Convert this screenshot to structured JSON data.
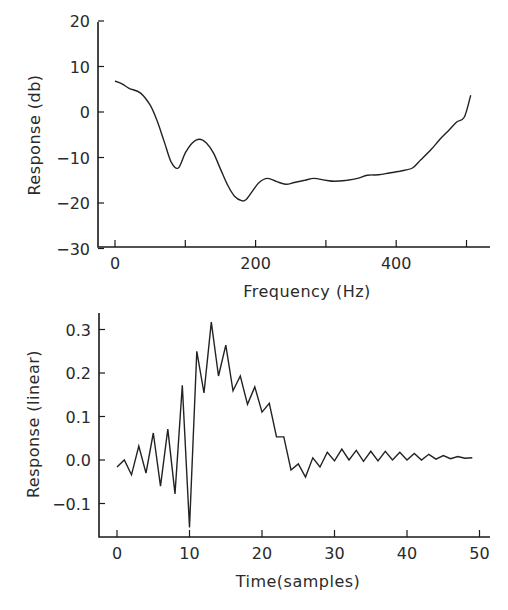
{
  "chart_data": [
    {
      "type": "line",
      "title": "",
      "xlabel": "Frequency (Hz)",
      "ylabel": "Response (db)",
      "xlim": [
        -25,
        530
      ],
      "ylim": [
        -30,
        20
      ],
      "xticks": [
        0,
        100,
        200,
        300,
        400,
        500
      ],
      "xtick_labels": [
        "0",
        "",
        "200",
        "",
        "400",
        ""
      ],
      "yticks": [
        20,
        10,
        0,
        -10,
        -20,
        -30
      ],
      "ytick_labels": [
        "20",
        "10",
        "0",
        "−10",
        "−20",
        "−30"
      ],
      "grid": false,
      "legend": null,
      "series": [
        {
          "name": "frequency response",
          "x": [
            0,
            10,
            20,
            36,
            50,
            60,
            70,
            80,
            90,
            100,
            110,
            120,
            130,
            140,
            150,
            160,
            170,
            180,
            186,
            195,
            205,
            217,
            230,
            243,
            255,
            270,
            283,
            300,
            312,
            330,
            345,
            359,
            375,
            390,
            405,
            423,
            435,
            450,
            461,
            475,
            486,
            497,
            506
          ],
          "y": [
            6.8,
            6.2,
            5.2,
            4.2,
            1.5,
            -2.0,
            -6.5,
            -11.0,
            -12.3,
            -9.0,
            -6.8,
            -6.0,
            -6.8,
            -9.0,
            -12.5,
            -16.0,
            -18.5,
            -19.5,
            -19.3,
            -17.5,
            -15.5,
            -14.6,
            -15.3,
            -15.9,
            -15.5,
            -15.0,
            -14.6,
            -15.0,
            -15.2,
            -15.0,
            -14.6,
            -13.9,
            -13.8,
            -13.4,
            -13.0,
            -12.3,
            -10.5,
            -8.2,
            -6.2,
            -4.0,
            -2.2,
            -1.1,
            3.7
          ]
        }
      ]
    },
    {
      "type": "line",
      "title": "",
      "xlabel": "Time(samples)",
      "ylabel": "Response (linear)",
      "xlim": [
        -2.5,
        51.5
      ],
      "ylim": [
        -0.18,
        0.34
      ],
      "xticks": [
        0,
        10,
        20,
        30,
        40,
        50
      ],
      "xtick_labels": [
        "0",
        "10",
        "20",
        "30",
        "40",
        "50"
      ],
      "yticks": [
        0.3,
        0.2,
        0.1,
        0.0,
        -0.1
      ],
      "ytick_labels": [
        "0.3",
        "0.2",
        "0.1",
        "0.0",
        "−0.1"
      ],
      "grid": false,
      "legend": null,
      "series": [
        {
          "name": "impulse response",
          "x": [
            0,
            1,
            2,
            3,
            4,
            5,
            6,
            7,
            8,
            9,
            10,
            11,
            12,
            13,
            14,
            15,
            16,
            17,
            18,
            19,
            20,
            21,
            22,
            23,
            24,
            25,
            26,
            27,
            28,
            29,
            30,
            31,
            32,
            33,
            34,
            35,
            36,
            37,
            38,
            39,
            40,
            41,
            42,
            43,
            44,
            45,
            46,
            47,
            48,
            49
          ],
          "y": [
            -0.016,
            0.0,
            -0.034,
            0.032,
            -0.03,
            0.062,
            -0.06,
            0.071,
            -0.078,
            0.172,
            -0.155,
            0.25,
            0.154,
            0.317,
            0.193,
            0.264,
            0.159,
            0.193,
            0.128,
            0.168,
            0.11,
            0.13,
            0.053,
            0.053,
            -0.023,
            -0.009,
            -0.039,
            0.005,
            -0.016,
            0.018,
            -0.002,
            0.025,
            0.0,
            0.022,
            -0.003,
            0.02,
            -0.002,
            0.02,
            0.0,
            0.018,
            0.0,
            0.015,
            0.0,
            0.013,
            0.002,
            0.01,
            0.003,
            0.008,
            0.004,
            0.005
          ]
        }
      ]
    }
  ],
  "figure": {
    "top_panel": {
      "xlabel": "Frequency (Hz)",
      "ylabel": "Response (db)"
    },
    "bottom_panel": {
      "xlabel": "Time(samples)",
      "ylabel": "Response (linear)"
    }
  }
}
